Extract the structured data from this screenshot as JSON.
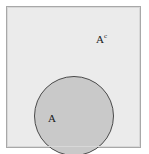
{
  "figure": {
    "type": "venn-diagram",
    "width": 149,
    "height": 154,
    "background_color": "#ffffff"
  },
  "universe": {
    "name": "universal-set-rectangle",
    "fill_color": "#ebebeb",
    "border_color": "#a8a8a8"
  },
  "set_a": {
    "name": "set-a-circle",
    "label": "A",
    "fill_color": "#c9c9c9",
    "border_color": "#4a4a4a"
  },
  "complement": {
    "name": "complement-region",
    "label_base": "A",
    "label_superscript": "c"
  }
}
